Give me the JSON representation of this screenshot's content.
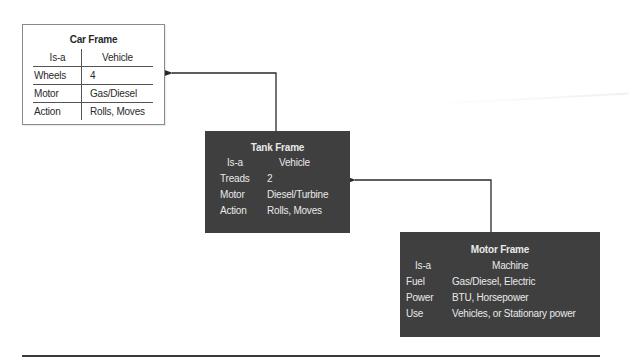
{
  "diagram": {
    "type": "frame-inheritance",
    "frames": [
      {
        "id": "car",
        "title": "Car Frame",
        "style": "light",
        "is_a": {
          "label": "Is-a",
          "value": "Vehicle"
        },
        "slots": [
          {
            "label": "Wheels",
            "value": "4"
          },
          {
            "label": "Motor",
            "value": "Gas/Diesel"
          },
          {
            "label": "Action",
            "value": "Rolls, Moves"
          }
        ]
      },
      {
        "id": "tank",
        "title": "Tank Frame",
        "style": "dark",
        "is_a": {
          "label": "Is-a",
          "value": "Vehicle"
        },
        "slots": [
          {
            "label": "Treads",
            "value": "2"
          },
          {
            "label": "Motor",
            "value": "Diesel/Turbine"
          },
          {
            "label": "Action",
            "value": "Rolls, Moves"
          }
        ]
      },
      {
        "id": "motor",
        "title": "Motor Frame",
        "style": "dark",
        "is_a": {
          "label": "Is-a",
          "value": "Machine"
        },
        "slots": [
          {
            "label": "Fuel",
            "value": "Gas/Diesel, Electric"
          },
          {
            "label": "Power",
            "value": "BTU, Horsepower"
          },
          {
            "label": "Use",
            "value": "Vehicles, or Stationary power"
          }
        ]
      }
    ],
    "edges": [
      {
        "from": "tank",
        "to": "car"
      },
      {
        "from": "motor",
        "to": "tank"
      }
    ],
    "colors": {
      "dark_frame_bg": "#3f3f3f",
      "dark_frame_text": "#e9e9e9",
      "light_frame_border": "#8a8a8a",
      "arrow": "#2a2a2a"
    }
  }
}
